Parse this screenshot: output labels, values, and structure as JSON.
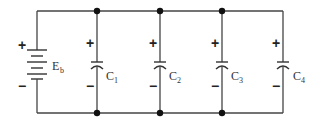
{
  "diagram": {
    "type": "circuit",
    "battery": {
      "label": "E",
      "subscript": "b",
      "plus": "+",
      "minus": "−"
    },
    "capacitors": [
      {
        "label": "C",
        "subscript": "1",
        "plus": "+",
        "minus": "−"
      },
      {
        "label": "C",
        "subscript": "2",
        "plus": "+",
        "minus": "−"
      },
      {
        "label": "C",
        "subscript": "3",
        "plus": "+",
        "minus": "−"
      },
      {
        "label": "C",
        "subscript": "4",
        "plus": "+",
        "minus": "−"
      }
    ],
    "colors": {
      "wire": "#444444",
      "node": "#111111",
      "background": "#ffffff"
    }
  }
}
